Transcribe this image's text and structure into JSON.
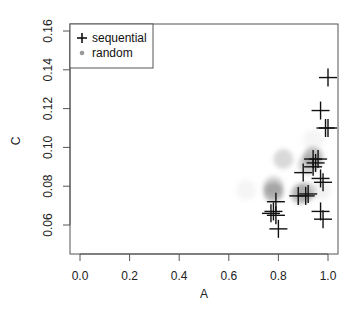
{
  "chart_data": {
    "type": "scatter",
    "title": "",
    "xlabel": "A",
    "ylabel": "C",
    "xlim": [
      -0.04,
      1.04
    ],
    "ylim": [
      0.052,
      0.162
    ],
    "x_ticks": [
      0.0,
      0.2,
      0.4,
      0.6,
      0.8,
      1.0
    ],
    "x_tick_labels": [
      "0.0",
      "0.2",
      "0.4",
      "0.6",
      "0.8",
      "1.0"
    ],
    "y_ticks": [
      0.06,
      0.08,
      0.1,
      0.12,
      0.14,
      0.16
    ],
    "y_tick_labels": [
      "0.06",
      "0.08",
      "0.10",
      "0.12",
      "0.14",
      "0.16"
    ],
    "grid": false,
    "legend": {
      "position": "top-left",
      "entries": [
        {
          "label": "sequential",
          "marker": "plus",
          "color": "#111111"
        },
        {
          "label": "random",
          "marker": "circle",
          "color": "#999999"
        }
      ]
    },
    "series": [
      {
        "name": "sequential",
        "marker": "plus",
        "color": "#111111",
        "points": [
          {
            "x": 1.0,
            "y": 0.136
          },
          {
            "x": 0.97,
            "y": 0.119
          },
          {
            "x": 0.99,
            "y": 0.11
          },
          {
            "x": 1.0,
            "y": 0.11
          },
          {
            "x": 0.94,
            "y": 0.094
          },
          {
            "x": 0.95,
            "y": 0.092
          },
          {
            "x": 0.96,
            "y": 0.094
          },
          {
            "x": 0.94,
            "y": 0.09
          },
          {
            "x": 0.9,
            "y": 0.087
          },
          {
            "x": 0.97,
            "y": 0.084
          },
          {
            "x": 0.98,
            "y": 0.082
          },
          {
            "x": 0.88,
            "y": 0.075
          },
          {
            "x": 0.91,
            "y": 0.075
          },
          {
            "x": 0.92,
            "y": 0.076
          },
          {
            "x": 0.79,
            "y": 0.072
          },
          {
            "x": 0.78,
            "y": 0.067
          },
          {
            "x": 0.77,
            "y": 0.066
          },
          {
            "x": 0.79,
            "y": 0.065
          },
          {
            "x": 0.8,
            "y": 0.058
          },
          {
            "x": 0.97,
            "y": 0.067
          },
          {
            "x": 0.98,
            "y": 0.063
          }
        ]
      },
      {
        "name": "random",
        "marker": "circle",
        "color": "#808080",
        "points": [
          {
            "x": 0.78,
            "y": 0.077,
            "alpha": 0.55
          },
          {
            "x": 0.78,
            "y": 0.08,
            "alpha": 0.35
          },
          {
            "x": 0.89,
            "y": 0.076,
            "alpha": 0.5
          },
          {
            "x": 0.91,
            "y": 0.077,
            "alpha": 0.35
          },
          {
            "x": 0.94,
            "y": 0.095,
            "alpha": 0.5
          },
          {
            "x": 0.92,
            "y": 0.091,
            "alpha": 0.35
          },
          {
            "x": 0.82,
            "y": 0.094,
            "alpha": 0.3
          },
          {
            "x": 0.67,
            "y": 0.078,
            "alpha": 0.08
          },
          {
            "x": 0.94,
            "y": 0.104,
            "alpha": 0.08
          },
          {
            "x": 0.97,
            "y": 0.078,
            "alpha": 0.1
          }
        ]
      }
    ]
  }
}
